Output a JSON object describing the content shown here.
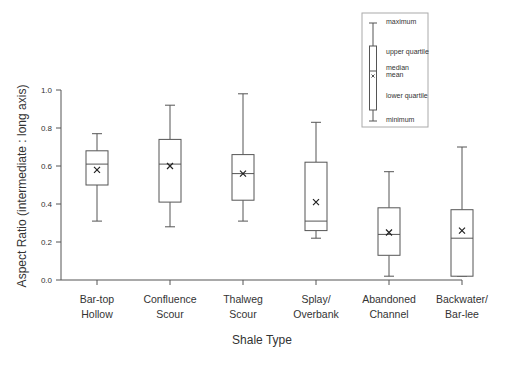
{
  "chart_data": {
    "type": "boxplot",
    "title": "",
    "xlabel": "Shale Type",
    "ylabel": "Aspect Ratio (intermediate : long axis)",
    "ylim": [
      0.0,
      1.0
    ],
    "yticks": [
      "0.0",
      "0.2",
      "0.4",
      "0.6",
      "0.8",
      "1.0"
    ],
    "grid": false,
    "categories": [
      [
        "Bar-top",
        "Hollow"
      ],
      [
        "Confluence",
        "Scour"
      ],
      [
        "Thalweg",
        "Scour"
      ],
      [
        "Splay/",
        "Overbank"
      ],
      [
        "Abandoned",
        "Channel"
      ],
      [
        "Backwater/",
        "Bar-lee"
      ]
    ],
    "series": [
      {
        "name": "Bar-top Hollow",
        "min": 0.31,
        "q1": 0.5,
        "median": 0.61,
        "mean": 0.58,
        "q3": 0.68,
        "max": 0.77
      },
      {
        "name": "Confluence Scour",
        "min": 0.28,
        "q1": 0.41,
        "median": 0.61,
        "mean": 0.6,
        "q3": 0.74,
        "max": 0.92
      },
      {
        "name": "Thalweg Scour",
        "min": 0.31,
        "q1": 0.42,
        "median": 0.56,
        "mean": 0.56,
        "q3": 0.66,
        "max": 0.98
      },
      {
        "name": "Splay/Overbank",
        "min": 0.22,
        "q1": 0.26,
        "median": 0.31,
        "mean": 0.41,
        "q3": 0.62,
        "max": 0.83
      },
      {
        "name": "Abandoned Channel",
        "min": 0.02,
        "q1": 0.13,
        "median": 0.24,
        "mean": 0.25,
        "q3": 0.38,
        "max": 0.57
      },
      {
        "name": "Backwater/Bar-lee",
        "min": 0.02,
        "q1": 0.02,
        "median": 0.22,
        "mean": 0.26,
        "q3": 0.37,
        "max": 0.7
      }
    ],
    "legend": {
      "position": "top-right",
      "labels": [
        "maximum",
        "upper quartile",
        "median",
        "mean",
        "lower quartile",
        "minimum"
      ],
      "mean_marker": "x"
    }
  },
  "style": {
    "line_color": "#555555",
    "text_color": "#333333",
    "legend_border": "#aaaaaa"
  }
}
